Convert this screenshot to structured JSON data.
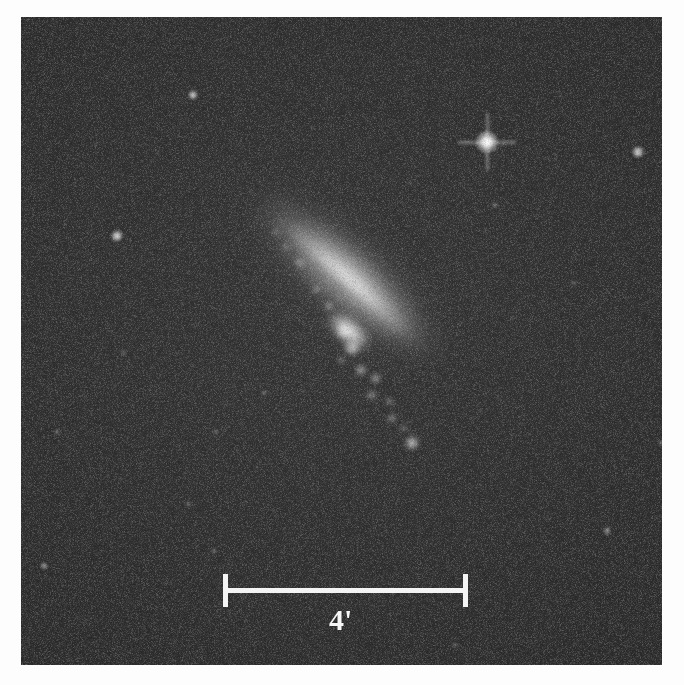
{
  "figure": {
    "kind": "astronomical-photographic-plate",
    "object_type": "inclined spiral galaxy",
    "background_color": "#2b2b2b",
    "plate_margin_color": "#fdfdfd"
  },
  "scalebar": {
    "label": "4'",
    "unit_name": "arcminutes",
    "value": 4,
    "left_px": 223,
    "right_px": 467,
    "length_px": 244,
    "y_px": 590,
    "color": "#f4f4f4"
  },
  "galaxy": {
    "name_visible": "",
    "center_x": 348,
    "center_y": 345,
    "position_angle_deg": 41,
    "major_axis_px": 286,
    "minor_axis_px": 80,
    "core_color": "#fcfcfc",
    "halo_color": "#c8c8c8",
    "knots": [
      {
        "x": 300,
        "y": 263,
        "r": 5,
        "a": 0.5
      },
      {
        "x": 286,
        "y": 247,
        "r": 4,
        "a": 0.42
      },
      {
        "x": 316,
        "y": 289,
        "r": 4.5,
        "a": 0.46
      },
      {
        "x": 329,
        "y": 306,
        "r": 5,
        "a": 0.5
      },
      {
        "x": 344,
        "y": 331,
        "r": 7,
        "a": 0.72
      },
      {
        "x": 352,
        "y": 348,
        "r": 8,
        "a": 0.8
      },
      {
        "x": 341,
        "y": 360,
        "r": 4.5,
        "a": 0.4
      },
      {
        "x": 361,
        "y": 370,
        "r": 6,
        "a": 0.62
      },
      {
        "x": 375,
        "y": 378,
        "r": 5.5,
        "a": 0.58
      },
      {
        "x": 372,
        "y": 395,
        "r": 5,
        "a": 0.52
      },
      {
        "x": 389,
        "y": 401,
        "r": 4.5,
        "a": 0.48
      },
      {
        "x": 392,
        "y": 418,
        "r": 5,
        "a": 0.5
      },
      {
        "x": 412,
        "y": 443,
        "r": 7,
        "a": 0.85
      },
      {
        "x": 404,
        "y": 428,
        "r": 4,
        "a": 0.4
      },
      {
        "x": 276,
        "y": 232,
        "r": 4,
        "a": 0.34
      }
    ]
  },
  "stars": [
    {
      "x": 487,
      "y": 142,
      "r": 11,
      "brightness": 1.0,
      "spikes": true,
      "name": "bright-star"
    },
    {
      "x": 193,
      "y": 95,
      "r": 5,
      "brightness": 0.72,
      "spikes": false,
      "name": "star"
    },
    {
      "x": 117,
      "y": 236,
      "r": 6,
      "brightness": 0.8,
      "spikes": false,
      "name": "star"
    },
    {
      "x": 638,
      "y": 152,
      "r": 6,
      "brightness": 0.78,
      "spikes": false,
      "name": "star"
    },
    {
      "x": 495,
      "y": 205,
      "r": 3,
      "brightness": 0.34,
      "spikes": false,
      "name": "faint-star"
    },
    {
      "x": 496,
      "y": 150,
      "r": 2,
      "brightness": 0.22,
      "spikes": false,
      "name": "faint-star"
    },
    {
      "x": 264,
      "y": 393,
      "r": 3,
      "brightness": 0.34,
      "spikes": false,
      "name": "faint-star"
    },
    {
      "x": 216,
      "y": 432,
      "r": 3,
      "brightness": 0.3,
      "spikes": false,
      "name": "faint-star"
    },
    {
      "x": 57,
      "y": 432,
      "r": 3,
      "brightness": 0.3,
      "spikets": false,
      "name": "faint-star"
    },
    {
      "x": 188,
      "y": 504,
      "r": 3,
      "brightness": 0.28,
      "spikes": false,
      "name": "faint-star"
    },
    {
      "x": 214,
      "y": 551,
      "r": 3,
      "brightness": 0.3,
      "spikes": false,
      "name": "faint-star"
    },
    {
      "x": 44,
      "y": 566,
      "r": 4,
      "brightness": 0.48,
      "spikes": false,
      "name": "faint-star"
    },
    {
      "x": 124,
      "y": 353,
      "r": 3,
      "brightness": 0.26,
      "spikes": false,
      "name": "faint-star"
    },
    {
      "x": 607,
      "y": 531,
      "r": 4,
      "brightness": 0.46,
      "spikes": false,
      "name": "faint-star"
    },
    {
      "x": 661,
      "y": 443,
      "r": 3,
      "brightness": 0.34,
      "spikes": false,
      "name": "faint-star"
    },
    {
      "x": 455,
      "y": 645,
      "r": 3,
      "brightness": 0.28,
      "spikes": false,
      "name": "faint-star"
    },
    {
      "x": 512,
      "y": 318,
      "r": 2,
      "brightness": 0.2,
      "spikes": false,
      "name": "faint-star"
    },
    {
      "x": 574,
      "y": 283,
      "r": 3,
      "brightness": 0.26,
      "spikes": false,
      "name": "faint-star"
    },
    {
      "x": 151,
      "y": 312,
      "r": 2,
      "brightness": 0.18,
      "spikes": false,
      "name": "faint-star"
    },
    {
      "x": 312,
      "y": 128,
      "r": 2,
      "brightness": 0.18,
      "spikes": false,
      "name": "faint-star"
    },
    {
      "x": 410,
      "y": 183,
      "r": 2,
      "brightness": 0.18,
      "spikes": false,
      "name": "faint-star"
    },
    {
      "x": 243,
      "y": 597,
      "r": 2,
      "brightness": 0.2,
      "spikes": false,
      "name": "faint-star"
    },
    {
      "x": 96,
      "y": 144,
      "r": 2,
      "brightness": 0.16,
      "spikes": false,
      "name": "faint-star"
    },
    {
      "x": 560,
      "y": 96,
      "r": 2,
      "brightness": 0.16,
      "spikes": false,
      "name": "faint-star"
    },
    {
      "x": 349,
      "y": 519,
      "r": 2,
      "brightness": 0.18,
      "spikes": false,
      "name": "faint-star"
    },
    {
      "x": 628,
      "y": 360,
      "r": 2,
      "brightness": 0.16,
      "spikes": false,
      "name": "faint-star"
    },
    {
      "x": 78,
      "y": 618,
      "r": 2,
      "brightness": 0.16,
      "spikes": false,
      "name": "faint-star"
    }
  ]
}
